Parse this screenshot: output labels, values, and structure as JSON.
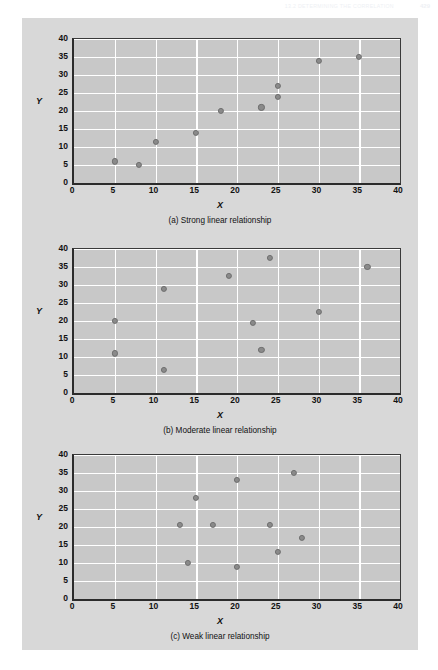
{
  "running_head": {
    "title": "13.2  Determining the Correlation",
    "page_number": "429"
  },
  "figure": {
    "axis": {
      "x_label": "X",
      "y_label": "Y",
      "x_ticks": [
        "0",
        "5",
        "10",
        "15",
        "20",
        "25",
        "30",
        "35",
        "40"
      ],
      "y_ticks": [
        "40",
        "35",
        "30",
        "25",
        "20",
        "15",
        "10",
        "5",
        "0"
      ]
    },
    "colors": {
      "panel_background": "#d8d8d8",
      "plot_background": "#c8c8c8",
      "gridline": "#ffffff",
      "marker": "#8a8a8a",
      "axis": "#2b2b2b",
      "text": "#111111"
    }
  },
  "chart_data": [
    {
      "type": "scatter",
      "title": "(a) Strong linear relationship",
      "xlabel": "X",
      "ylabel": "Y",
      "xlim": [
        0,
        40
      ],
      "ylim": [
        0,
        40
      ],
      "xticks": [
        0,
        5,
        10,
        15,
        20,
        25,
        30,
        35,
        40
      ],
      "yticks": [
        0,
        5,
        10,
        15,
        20,
        25,
        30,
        35,
        40
      ],
      "grid": true,
      "legend": "none",
      "points": [
        {
          "x": 5,
          "y": 6
        },
        {
          "x": 8,
          "y": 5
        },
        {
          "x": 10,
          "y": 11.5
        },
        {
          "x": 15,
          "y": 14
        },
        {
          "x": 18,
          "y": 20
        },
        {
          "x": 23,
          "y": 21
        },
        {
          "x": 25,
          "y": 27
        },
        {
          "x": 25,
          "y": 24
        },
        {
          "x": 30,
          "y": 34
        },
        {
          "x": 35,
          "y": 35
        }
      ]
    },
    {
      "type": "scatter",
      "title": "(b) Moderate linear relationship",
      "xlabel": "X",
      "ylabel": "Y",
      "xlim": [
        0,
        40
      ],
      "ylim": [
        0,
        40
      ],
      "xticks": [
        0,
        5,
        10,
        15,
        20,
        25,
        30,
        35,
        40
      ],
      "yticks": [
        0,
        5,
        10,
        15,
        20,
        25,
        30,
        35,
        40
      ],
      "grid": true,
      "legend": "none",
      "points": [
        {
          "x": 5,
          "y": 20
        },
        {
          "x": 5,
          "y": 11
        },
        {
          "x": 11,
          "y": 29
        },
        {
          "x": 11,
          "y": 6.5
        },
        {
          "x": 19,
          "y": 32.5
        },
        {
          "x": 22,
          "y": 19.5
        },
        {
          "x": 23,
          "y": 12
        },
        {
          "x": 24,
          "y": 37.5
        },
        {
          "x": 30,
          "y": 22.5
        },
        {
          "x": 36,
          "y": 35
        }
      ]
    },
    {
      "type": "scatter",
      "title": "(c) Weak linear relationship",
      "xlabel": "X",
      "ylabel": "Y",
      "xlim": [
        0,
        40
      ],
      "ylim": [
        0,
        40
      ],
      "xticks": [
        0,
        5,
        10,
        15,
        20,
        25,
        30,
        35,
        40
      ],
      "yticks": [
        0,
        5,
        10,
        15,
        20,
        25,
        30,
        35,
        40
      ],
      "grid": true,
      "legend": "none",
      "points": [
        {
          "x": 13,
          "y": 20.5
        },
        {
          "x": 14,
          "y": 10
        },
        {
          "x": 15,
          "y": 28
        },
        {
          "x": 17,
          "y": 20.5
        },
        {
          "x": 20,
          "y": 33
        },
        {
          "x": 20,
          "y": 9
        },
        {
          "x": 24,
          "y": 20.5
        },
        {
          "x": 25,
          "y": 13
        },
        {
          "x": 27,
          "y": 35
        },
        {
          "x": 28,
          "y": 17
        }
      ]
    }
  ]
}
